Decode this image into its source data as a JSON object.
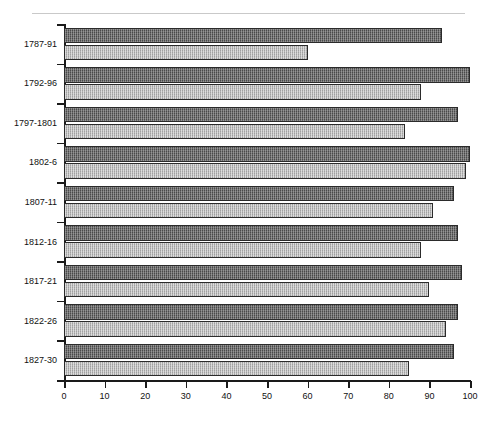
{
  "chart_data": {
    "type": "bar",
    "orientation": "horizontal",
    "title": "",
    "subtitle": "",
    "xlabel": "",
    "ylabel": "",
    "xlim": [
      0,
      100
    ],
    "xticks": [
      0,
      10,
      20,
      30,
      40,
      50,
      60,
      70,
      80,
      90,
      100
    ],
    "xtick_labels": [
      "0",
      "10",
      "20",
      "30",
      "40",
      "50",
      "60",
      "70",
      "80",
      "90",
      "100"
    ],
    "grid": false,
    "legend": "none",
    "categories": [
      "1787-91",
      "1792-96",
      "1797-1801",
      "1802-6",
      "1807-11",
      "1812-16",
      "1817-21",
      "1822-26",
      "1827-30"
    ],
    "series": [
      {
        "name": "series-1",
        "style": "dark-dotted",
        "color": "#4a4a4a",
        "values": [
          93,
          100,
          97,
          100,
          96,
          97,
          98,
          97,
          96
        ]
      },
      {
        "name": "series-2",
        "style": "light-checker",
        "color": "#b3b3b3",
        "values": [
          60,
          88,
          84,
          99,
          91,
          88,
          90,
          94,
          85
        ]
      }
    ]
  },
  "axis": {
    "top_rule_visible": true,
    "y_axis_visible": true,
    "x_axis_visible": true
  }
}
